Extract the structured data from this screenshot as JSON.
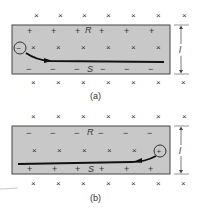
{
  "figure": {
    "panels": [
      {
        "id": "a",
        "caption": "(a)",
        "top_label": "R",
        "bottom_label": "S",
        "dimension_label": "l",
        "top_charge_sign": "+",
        "bottom_charge_sign": "−",
        "carrier_sign": "−",
        "field_symbol": "×"
      },
      {
        "id": "b",
        "caption": "(b)",
        "top_label": "R",
        "bottom_label": "S",
        "dimension_label": "l",
        "top_charge_sign": "−",
        "bottom_charge_sign": "+",
        "carrier_sign": "+",
        "field_symbol": "×"
      }
    ],
    "colors": {
      "strip_fill": "#c8c8c8",
      "strip_border": "#444444",
      "ink": "#222222"
    }
  }
}
